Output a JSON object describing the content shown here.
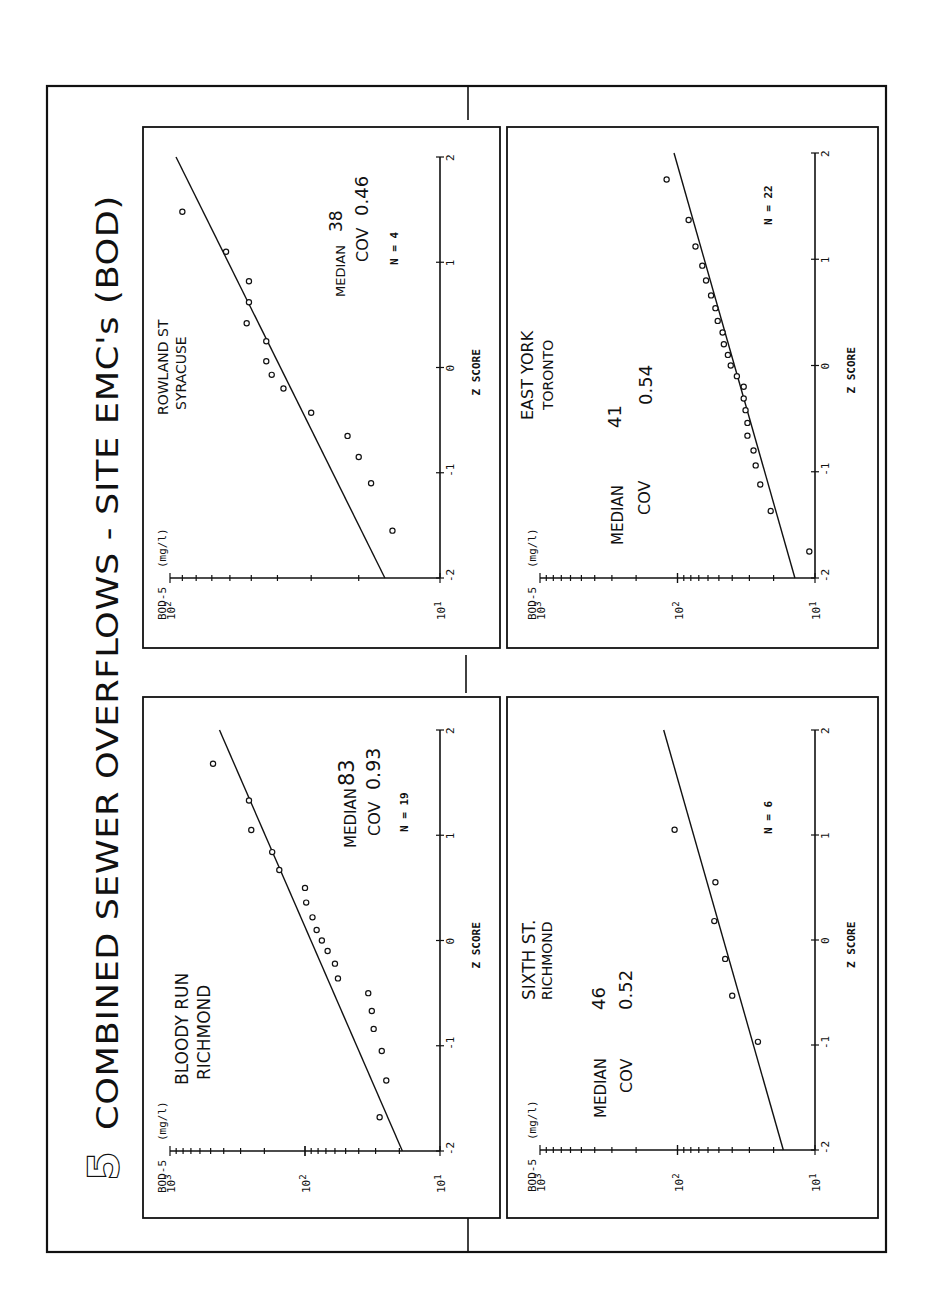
{
  "figure": {
    "number": "5",
    "title": "COMBINED SEWER OVERFLOWS  -  SITE EMC's  (BOD)",
    "orientation": "rotated 90 degrees counter-clockwise"
  },
  "chart_data": [
    {
      "type": "scatter",
      "title": "BLOODY RUN RICHMOND",
      "site_lines": [
        "BLOODY RUN",
        "RICHMOND"
      ],
      "xlabel": "Z SCORE",
      "ylabel": "BOD-5",
      "yunits": "(mg/l)",
      "yscale": "log",
      "ylim": [
        10,
        1000
      ],
      "ytick_labels": [
        "10^1",
        "10^2",
        "10^3"
      ],
      "xlim": [
        -2,
        2
      ],
      "xtick_labels": [
        "-2",
        "-1",
        "0",
        "1",
        "2"
      ],
      "stats": {
        "median_label": "MEDIAN",
        "median": "83",
        "cov_label": "COV",
        "cov": "0.93",
        "n_label": "N =",
        "n": "19"
      },
      "fit_line": {
        "z": [
          -2,
          2
        ],
        "value": [
          19,
          430
        ]
      },
      "points": [
        {
          "z": -1.68,
          "value": 28
        },
        {
          "z": -1.33,
          "value": 25
        },
        {
          "z": -1.05,
          "value": 27
        },
        {
          "z": -0.84,
          "value": 31
        },
        {
          "z": -0.67,
          "value": 32
        },
        {
          "z": -0.5,
          "value": 34
        },
        {
          "z": -0.36,
          "value": 57
        },
        {
          "z": -0.22,
          "value": 60
        },
        {
          "z": -0.1,
          "value": 68
        },
        {
          "z": 0.0,
          "value": 75
        },
        {
          "z": 0.1,
          "value": 82
        },
        {
          "z": 0.22,
          "value": 88
        },
        {
          "z": 0.36,
          "value": 98
        },
        {
          "z": 0.5,
          "value": 100
        },
        {
          "z": 0.67,
          "value": 155
        },
        {
          "z": 0.84,
          "value": 175
        },
        {
          "z": 1.05,
          "value": 250
        },
        {
          "z": 1.33,
          "value": 260
        },
        {
          "z": 1.68,
          "value": 480
        }
      ]
    },
    {
      "type": "scatter",
      "title": "ROWLAND ST SYRACUSE",
      "site_lines": [
        "ROWLAND ST",
        "SYRACUSE"
      ],
      "xlabel": "Z SCORE",
      "ylabel": "BOD-5",
      "yunits": "(mg/l)",
      "yscale": "log",
      "ylim": [
        10,
        100
      ],
      "ytick_labels": [
        "10^1",
        "10^2"
      ],
      "xlim": [
        -2,
        2
      ],
      "xtick_labels": [
        "-2",
        "-1",
        "0",
        "1",
        "2"
      ],
      "stats": {
        "median_label": "MEDIAN",
        "median": "38",
        "cov_label": "COV",
        "cov": "0.46",
        "n_label": "N =",
        "n": "4"
      },
      "fit_line": {
        "z": [
          -2,
          2
        ],
        "value": [
          16,
          95
        ]
      },
      "points": [
        {
          "z": -1.55,
          "value": 15
        },
        {
          "z": -1.1,
          "value": 18
        },
        {
          "z": -0.85,
          "value": 20
        },
        {
          "z": -0.65,
          "value": 22
        },
        {
          "z": -0.43,
          "value": 30
        },
        {
          "z": -0.2,
          "value": 38
        },
        {
          "z": -0.07,
          "value": 42
        },
        {
          "z": 0.06,
          "value": 44
        },
        {
          "z": 0.25,
          "value": 44
        },
        {
          "z": 0.42,
          "value": 52
        },
        {
          "z": 0.62,
          "value": 51
        },
        {
          "z": 0.82,
          "value": 51
        },
        {
          "z": 1.1,
          "value": 62
        },
        {
          "z": 1.48,
          "value": 90
        }
      ]
    },
    {
      "type": "scatter",
      "title": "EAST YORK TORONTO",
      "site_lines": [
        "EAST YORK",
        "TORONTO"
      ],
      "xlabel": "Z SCORE",
      "ylabel": "BOD-5",
      "yunits": "(mg/l)",
      "yscale": "log",
      "ylim": [
        10,
        1000
      ],
      "ytick_labels": [
        "10^1",
        "10^2",
        "10^3"
      ],
      "xlim": [
        -2,
        2
      ],
      "xtick_labels": [
        "-2",
        "-1",
        "0",
        "1",
        "2"
      ],
      "stats": {
        "median_label": "MEDIAN",
        "median": "41",
        "cov_label": "COV",
        "cov": "0.54",
        "n_label": "N =",
        "n": "22"
      },
      "fit_line": {
        "z": [
          -2,
          2
        ],
        "value": [
          14,
          106
        ]
      },
      "points": [
        {
          "z": -1.75,
          "value": 11
        },
        {
          "z": -1.37,
          "value": 21
        },
        {
          "z": -1.12,
          "value": 25
        },
        {
          "z": -0.94,
          "value": 27
        },
        {
          "z": -0.8,
          "value": 28
        },
        {
          "z": -0.66,
          "value": 31
        },
        {
          "z": -0.54,
          "value": 31
        },
        {
          "z": -0.42,
          "value": 32
        },
        {
          "z": -0.31,
          "value": 33
        },
        {
          "z": -0.2,
          "value": 33
        },
        {
          "z": -0.1,
          "value": 37
        },
        {
          "z": 0.0,
          "value": 41
        },
        {
          "z": 0.1,
          "value": 43
        },
        {
          "z": 0.2,
          "value": 46
        },
        {
          "z": 0.31,
          "value": 47
        },
        {
          "z": 0.42,
          "value": 51
        },
        {
          "z": 0.54,
          "value": 53
        },
        {
          "z": 0.66,
          "value": 57
        },
        {
          "z": 0.8,
          "value": 62
        },
        {
          "z": 0.94,
          "value": 66
        },
        {
          "z": 1.12,
          "value": 74
        },
        {
          "z": 1.37,
          "value": 83
        },
        {
          "z": 1.75,
          "value": 120
        }
      ]
    },
    {
      "type": "scatter",
      "title": "SIXTH ST. RICHMOND",
      "site_lines": [
        "SIXTH ST.",
        "RICHMOND"
      ],
      "xlabel": "Z SCORE",
      "ylabel": "BOD-5",
      "yunits": "(mg/l)",
      "yscale": "log",
      "ylim": [
        10,
        1000
      ],
      "ytick_labels": [
        "10^1",
        "10^2",
        "10^3"
      ],
      "xlim": [
        -2,
        2
      ],
      "xtick_labels": [
        "-2",
        "-1",
        "0",
        "1",
        "2"
      ],
      "stats": {
        "median_label": "MEDIAN",
        "median": "46",
        "cov_label": "COV",
        "cov": "0.52",
        "n_label": "N =",
        "n": "6"
      },
      "fit_line": {
        "z": [
          -2,
          2
        ],
        "value": [
          17,
          126
        ]
      },
      "points": [
        {
          "z": -0.97,
          "value": 26
        },
        {
          "z": -0.53,
          "value": 40
        },
        {
          "z": -0.18,
          "value": 45
        },
        {
          "z": 0.18,
          "value": 54
        },
        {
          "z": 0.55,
          "value": 53
        },
        {
          "z": 1.05,
          "value": 105
        }
      ]
    }
  ],
  "panels": [
    {
      "id": "bloody-run",
      "box": [
        143,
        697,
        500,
        1218
      ],
      "axis_y": 1151,
      "bod_x": [
        170,
        440
      ],
      "z_y": [
        1151,
        730
      ]
    },
    {
      "id": "rowland-st",
      "box": [
        143,
        127,
        500,
        648
      ],
      "axis_y": 578,
      "bod_x": [
        170,
        440
      ],
      "z_y": [
        578,
        157
      ]
    },
    {
      "id": "east-york",
      "box": [
        507,
        127,
        878,
        648
      ],
      "axis_y": 578,
      "bod_x": [
        540,
        815
      ],
      "z_y": [
        578,
        153
      ]
    },
    {
      "id": "sixth-st",
      "box": [
        507,
        697,
        878,
        1218
      ],
      "axis_y": 1150,
      "bod_x": [
        540,
        815
      ],
      "z_y": [
        1150,
        730
      ]
    }
  ]
}
